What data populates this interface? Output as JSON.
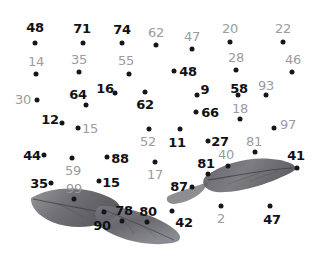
{
  "canvas": {
    "width": 318,
    "height": 260,
    "background": "#ffffff",
    "title": "connect-the-dots leaf puzzle"
  },
  "palette": {
    "dot_color": "#16161a",
    "label_dark": "#111115",
    "label_gray": "#9b9ba0",
    "leaf_dark": "#4a4a4e",
    "leaf_mid": "#6f6f74",
    "leaf_light": "#9a9aa0",
    "vein_color": "#3a3a3e"
  },
  "dots": [
    {
      "label": "48",
      "tone": "dark",
      "dot_x": 35,
      "dot_y": 43,
      "label_x": 35,
      "label_y": 27
    },
    {
      "label": "71",
      "tone": "dark",
      "dot_x": 83,
      "dot_y": 43,
      "label_x": 82,
      "label_y": 28
    },
    {
      "label": "74",
      "tone": "dark",
      "dot_x": 122,
      "dot_y": 43,
      "label_x": 122,
      "label_y": 29
    },
    {
      "label": "62",
      "tone": "gray",
      "dot_x": 156,
      "dot_y": 45,
      "label_x": 156,
      "label_y": 32
    },
    {
      "label": "47",
      "tone": "gray",
      "dot_x": 192,
      "dot_y": 49,
      "label_x": 192,
      "label_y": 36
    },
    {
      "label": "20",
      "tone": "gray",
      "dot_x": 230,
      "dot_y": 42,
      "label_x": 230,
      "label_y": 28
    },
    {
      "label": "22",
      "tone": "gray",
      "dot_x": 283,
      "dot_y": 42,
      "label_x": 283,
      "label_y": 28
    },
    {
      "label": "14",
      "tone": "gray",
      "dot_x": 36,
      "dot_y": 74,
      "label_x": 36,
      "label_y": 61
    },
    {
      "label": "35",
      "tone": "gray",
      "dot_x": 79,
      "dot_y": 72,
      "label_x": 79,
      "label_y": 59
    },
    {
      "label": "55",
      "tone": "gray",
      "dot_x": 129,
      "dot_y": 74,
      "label_x": 126,
      "label_y": 60
    },
    {
      "label": "48",
      "tone": "dark",
      "dot_x": 174,
      "dot_y": 71,
      "label_x": 188,
      "label_y": 71
    },
    {
      "label": "28",
      "tone": "gray",
      "dot_x": 236,
      "dot_y": 70,
      "label_x": 236,
      "label_y": 57
    },
    {
      "label": "46",
      "tone": "gray",
      "dot_x": 292,
      "dot_y": 72,
      "label_x": 293,
      "label_y": 59
    },
    {
      "label": "30",
      "tone": "gray",
      "dot_x": 37,
      "dot_y": 100,
      "label_x": 23,
      "label_y": 99
    },
    {
      "label": "64",
      "tone": "dark",
      "dot_x": 86,
      "dot_y": 105,
      "label_x": 78,
      "label_y": 94
    },
    {
      "label": "16",
      "tone": "dark",
      "dot_x": 115,
      "dot_y": 93,
      "label_x": 105,
      "label_y": 88
    },
    {
      "label": "62",
      "tone": "dark",
      "dot_x": 145,
      "dot_y": 92,
      "label_x": 145,
      "label_y": 104
    },
    {
      "label": "9",
      "tone": "dark",
      "dot_x": 197,
      "dot_y": 95,
      "label_x": 205,
      "label_y": 89
    },
    {
      "label": "58",
      "tone": "dark",
      "dot_x": 238,
      "dot_y": 95,
      "label_x": 239,
      "label_y": 88
    },
    {
      "label": "93",
      "tone": "gray",
      "dot_x": 266,
      "dot_y": 95,
      "label_x": 266,
      "label_y": 85
    },
    {
      "label": "12",
      "tone": "dark",
      "dot_x": 62,
      "dot_y": 123,
      "label_x": 50,
      "label_y": 119
    },
    {
      "label": "66",
      "tone": "dark",
      "dot_x": 196,
      "dot_y": 112,
      "label_x": 210,
      "label_y": 112
    },
    {
      "label": "18",
      "tone": "gray",
      "dot_x": 240,
      "dot_y": 119,
      "label_x": 240,
      "label_y": 108
    },
    {
      "label": "97",
      "tone": "gray",
      "dot_x": 274,
      "dot_y": 128,
      "label_x": 288,
      "label_y": 124
    },
    {
      "label": "15",
      "tone": "gray",
      "dot_x": 78,
      "dot_y": 128,
      "label_x": 90,
      "label_y": 128
    },
    {
      "label": "52",
      "tone": "gray",
      "dot_x": 149,
      "dot_y": 129,
      "label_x": 148,
      "label_y": 141
    },
    {
      "label": "11",
      "tone": "dark",
      "dot_x": 180,
      "dot_y": 129,
      "label_x": 177,
      "label_y": 142
    },
    {
      "label": "27",
      "tone": "dark",
      "dot_x": 208,
      "dot_y": 141,
      "label_x": 220,
      "label_y": 141
    },
    {
      "label": "44",
      "tone": "dark",
      "dot_x": 44,
      "dot_y": 155,
      "label_x": 32,
      "label_y": 155
    },
    {
      "label": "88",
      "tone": "dark",
      "dot_x": 107,
      "dot_y": 157,
      "label_x": 120,
      "label_y": 158
    },
    {
      "label": "59",
      "tone": "gray",
      "dot_x": 72,
      "dot_y": 158,
      "label_x": 73,
      "label_y": 170
    },
    {
      "label": "81",
      "tone": "gray",
      "dot_x": 255,
      "dot_y": 152,
      "label_x": 254,
      "label_y": 141
    },
    {
      "label": "41",
      "tone": "dark",
      "dot_x": 297,
      "dot_y": 168,
      "label_x": 296,
      "label_y": 155
    },
    {
      "label": "40",
      "tone": "gray",
      "dot_x": 228,
      "dot_y": 166,
      "label_x": 226,
      "label_y": 154
    },
    {
      "label": "17",
      "tone": "gray",
      "dot_x": 155,
      "dot_y": 162,
      "label_x": 155,
      "label_y": 174
    },
    {
      "label": "81",
      "tone": "dark",
      "dot_x": 208,
      "dot_y": 174,
      "label_x": 206,
      "label_y": 163
    },
    {
      "label": "35",
      "tone": "dark",
      "dot_x": 51,
      "dot_y": 183,
      "label_x": 39,
      "label_y": 183
    },
    {
      "label": "15",
      "tone": "dark",
      "dot_x": 99,
      "dot_y": 181,
      "label_x": 111,
      "label_y": 182
    },
    {
      "label": "87",
      "tone": "dark",
      "dot_x": 192,
      "dot_y": 187,
      "label_x": 179,
      "label_y": 186
    },
    {
      "label": "99",
      "tone": "gray",
      "dot_x": 74,
      "dot_y": 199,
      "label_x": 74,
      "label_y": 188
    },
    {
      "label": "90",
      "tone": "dark",
      "dot_x": 104,
      "dot_y": 212,
      "label_x": 102,
      "label_y": 225
    },
    {
      "label": "78",
      "tone": "dark",
      "dot_x": 122,
      "dot_y": 221,
      "label_x": 124,
      "label_y": 210
    },
    {
      "label": "80",
      "tone": "dark",
      "dot_x": 147,
      "dot_y": 222,
      "label_x": 148,
      "label_y": 211
    },
    {
      "label": "42",
      "tone": "dark",
      "dot_x": 172,
      "dot_y": 211,
      "label_x": 184,
      "label_y": 222
    },
    {
      "label": "2",
      "tone": "gray",
      "dot_x": 221,
      "dot_y": 206,
      "label_x": 221,
      "label_y": 218
    },
    {
      "label": "47",
      "tone": "dark",
      "dot_x": 270,
      "dot_y": 206,
      "label_x": 272,
      "label_y": 219
    }
  ],
  "leaves": [
    {
      "name": "leaf-left",
      "description": "elongated pointed leaf angled up-right"
    },
    {
      "name": "leaf-lower",
      "description": "leaf pointing down-right"
    },
    {
      "name": "leaf-right",
      "description": "leaf pointing up-right toward 41"
    }
  ]
}
